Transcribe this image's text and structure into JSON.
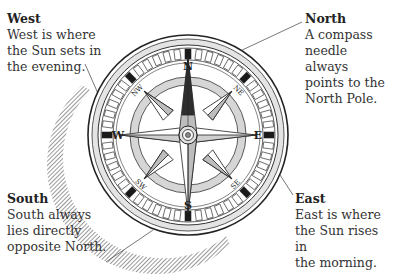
{
  "labels": {
    "west": {
      "title": "West",
      "body": "West is where\nthe Sun sets in\nthe evening."
    },
    "north": {
      "title": "North",
      "body": "A compass\nneedle always\npoints to the\nNorth Pole."
    },
    "south": {
      "title": "South",
      "body": "South always\nlies directly\nopposite North."
    },
    "east": {
      "title": "East",
      "body": "East is where\nthe Sun rises in\nthe morning."
    }
  },
  "compass": {
    "cardinals": {
      "n": "N",
      "e": "E",
      "s": "S",
      "w": "W"
    },
    "intercardinals": {
      "ne": "NE",
      "se": "SE",
      "sw": "SW",
      "nw": "NW"
    }
  },
  "colors": {
    "ink": "#222222",
    "ring_fill": "#d9d9d9",
    "needle_dark": "#333333",
    "needle_light": "#bdbdbd"
  }
}
